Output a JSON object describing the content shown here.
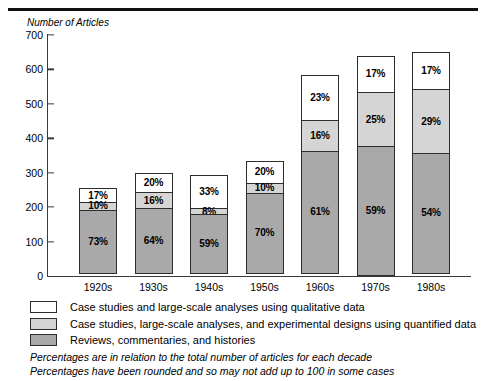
{
  "figure": {
    "y_axis_title": "Number of Articles"
  },
  "chart_data": {
    "type": "bar",
    "subtype": "stacked-bar",
    "title": "",
    "xlabel": "",
    "ylabel": "Number of Articles",
    "ylim": [
      0,
      700
    ],
    "yticks": [
      0,
      100,
      200,
      300,
      400,
      500,
      600,
      700
    ],
    "ytick_labels": [
      "0",
      "100",
      "200",
      "300",
      "400",
      "500",
      "600",
      "700"
    ],
    "grid": false,
    "legend_position": "below-axes",
    "categories": [
      "1920s",
      "1930s",
      "1940s",
      "1950s",
      "1960s",
      "1970s",
      "1980s"
    ],
    "totals": [
      255,
      300,
      292,
      335,
      585,
      640,
      650
    ],
    "series": [
      {
        "name": "Reviews, commentaries, and histories",
        "color": "#a9a9a9",
        "values": [
          73,
          64,
          59,
          70,
          61,
          59,
          54
        ],
        "labels": [
          "73%",
          "64%",
          "59%",
          "70%",
          "61%",
          "59%",
          "54%"
        ]
      },
      {
        "name": "Case studies, large-scale analyses, and experimental designs using quantified data",
        "color": "#d5d5d5",
        "values": [
          10,
          16,
          8,
          10,
          16,
          25,
          29
        ],
        "labels": [
          "10%",
          "16%",
          "8%",
          "10%",
          "16%",
          "25%",
          "29%"
        ]
      },
      {
        "name": "Case studies and large-scale analyses using qualitative data",
        "color": "#ffffff",
        "values": [
          17,
          20,
          33,
          20,
          23,
          17,
          17
        ],
        "labels": [
          "17%",
          "20%",
          "33%",
          "20%",
          "23%",
          "17%",
          "17%"
        ]
      }
    ],
    "annotations": [
      "Percentages are in relation to the total number of articles for each decade",
      "Percentages have been rounded and so may not add up to 100 in some cases"
    ]
  },
  "legend": [
    {
      "swatch_color": "#ffffff",
      "label": "Case studies and large-scale analyses using qualitative data"
    },
    {
      "swatch_color": "#d5d5d5",
      "label": "Case studies, large-scale analyses, and experimental designs using quantified data"
    },
    {
      "swatch_color": "#a9a9a9",
      "label": "Reviews, commentaries, and histories"
    }
  ],
  "footnotes": [
    "Percentages are in relation to the total number of articles for each decade",
    "Percentages have been rounded and so may not add up to 100 in some cases"
  ]
}
